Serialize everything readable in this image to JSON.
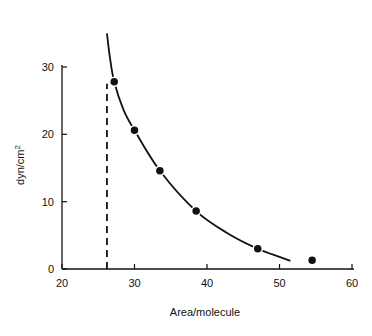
{
  "chart_data": {
    "type": "scatter",
    "title": "",
    "xlabel": "Area/molecule",
    "ylabel": "dyn/cm²",
    "xlim": [
      20,
      60
    ],
    "ylim": [
      0,
      30
    ],
    "x_ticks": [
      20,
      30,
      40,
      50,
      60
    ],
    "y_ticks": [
      0,
      10,
      20,
      30
    ],
    "grid": false,
    "legend": null,
    "series": [
      {
        "name": "measured points",
        "x": [
          27.2,
          30.0,
          33.5,
          38.5,
          47.0,
          54.5
        ],
        "y": [
          27.8,
          20.6,
          14.6,
          8.6,
          3.0,
          1.3
        ]
      }
    ],
    "fitted_curve": {
      "style": "solid",
      "x": [
        26.2,
        26.6,
        27.2,
        28.5,
        30.0,
        33.5,
        38.5,
        43.0,
        47.0,
        50.0,
        51.5
      ],
      "y": [
        35,
        31.5,
        27.8,
        23.6,
        20.6,
        14.6,
        8.6,
        5.2,
        3.0,
        1.8,
        1.2
      ]
    },
    "annotation_line": {
      "style": "dashed",
      "x": 26.2,
      "y_from": 0,
      "y_to": 27.5
    }
  },
  "axes": {
    "xlabel": "Area/molecule",
    "ylabel": "dyn/cm",
    "ylabel_sup": "2",
    "x_tick_labels": [
      "20",
      "30",
      "40",
      "50",
      "60"
    ],
    "y_tick_labels": [
      "0",
      "10",
      "20",
      "30"
    ]
  }
}
